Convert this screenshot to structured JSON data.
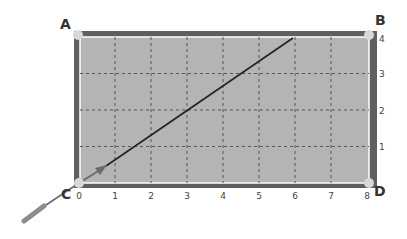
{
  "diagram": {
    "corners": [
      {
        "id": "A",
        "label": "A",
        "grid": [
          0,
          4
        ]
      },
      {
        "id": "B",
        "label": "B",
        "grid": [
          8,
          4
        ]
      },
      {
        "id": "C",
        "label": "C",
        "grid": [
          0,
          0
        ]
      },
      {
        "id": "D",
        "label": "D",
        "grid": [
          8,
          0
        ]
      }
    ],
    "x_ticks": [
      "0",
      "1",
      "2",
      "3",
      "4",
      "5",
      "6",
      "7",
      "8"
    ],
    "y_ticks": [
      "1",
      "2",
      "3",
      "4"
    ],
    "grid": {
      "columns": 8,
      "rows": 4,
      "line_style": "dashed"
    },
    "path": {
      "start": [
        0,
        0
      ],
      "end": [
        6,
        4
      ],
      "description": "ball travels from corner C toward top edge at x=6"
    },
    "cue": {
      "position": "lower-left of corner C",
      "aim_direction": "up-right"
    },
    "colors": {
      "felt": "#b4b4b4",
      "rail": "#5f5f5f",
      "rail_highlight": "#ffffff",
      "pocket": "#d8d8d8",
      "path": "#222222",
      "arrow": "#6a6a6a",
      "grid": "#555555",
      "cue": "#8c8c8c"
    }
  }
}
